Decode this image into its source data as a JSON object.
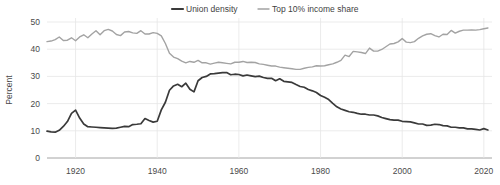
{
  "chart_data": {
    "type": "line",
    "title": "",
    "xlabel": "",
    "ylabel": "Percent",
    "xlim": [
      1913,
      2022
    ],
    "ylim": [
      0,
      50
    ],
    "grid": true,
    "legend_position": "top-center",
    "xticks": [
      1920,
      1940,
      1960,
      1980,
      2000,
      2020
    ],
    "yticks": [
      0,
      10,
      20,
      30,
      40,
      50
    ],
    "x": [
      1913,
      1914,
      1915,
      1916,
      1917,
      1918,
      1919,
      1920,
      1921,
      1922,
      1923,
      1924,
      1925,
      1926,
      1927,
      1928,
      1929,
      1930,
      1931,
      1932,
      1933,
      1934,
      1935,
      1936,
      1937,
      1938,
      1939,
      1940,
      1941,
      1942,
      1943,
      1944,
      1945,
      1946,
      1947,
      1948,
      1949,
      1950,
      1951,
      1952,
      1953,
      1954,
      1955,
      1956,
      1957,
      1958,
      1959,
      1960,
      1961,
      1962,
      1963,
      1964,
      1965,
      1966,
      1967,
      1968,
      1969,
      1970,
      1971,
      1972,
      1973,
      1974,
      1975,
      1976,
      1977,
      1978,
      1979,
      1980,
      1981,
      1982,
      1983,
      1984,
      1985,
      1986,
      1987,
      1988,
      1989,
      1990,
      1991,
      1992,
      1993,
      1994,
      1995,
      1996,
      1997,
      1998,
      1999,
      2000,
      2001,
      2002,
      2003,
      2004,
      2005,
      2006,
      2007,
      2008,
      2009,
      2010,
      2011,
      2012,
      2013,
      2014,
      2015,
      2016,
      2017,
      2018,
      2019,
      2020,
      2021
    ],
    "series": [
      {
        "name": "Union density",
        "color": "#3a3a3a",
        "width": 1.7,
        "values": [
          9.9,
          9.6,
          9.5,
          10.2,
          11.6,
          13.4,
          16.4,
          17.6,
          14.7,
          12.5,
          11.5,
          11.4,
          11.3,
          11.2,
          11.1,
          11.0,
          10.9,
          11.0,
          11.3,
          11.6,
          11.5,
          12.3,
          12.4,
          12.6,
          14.5,
          13.8,
          13.2,
          13.5,
          17.7,
          20.5,
          24.9,
          26.5,
          27.1,
          26.2,
          27.5,
          25.3,
          24.3,
          28.4,
          29.6,
          30.0,
          30.9,
          31.0,
          31.2,
          31.4,
          31.4,
          30.6,
          30.8,
          30.7,
          30.2,
          30.5,
          30.2,
          29.9,
          30.1,
          29.6,
          29.3,
          29.3,
          28.4,
          29.1,
          28.2,
          28.0,
          27.8,
          27.0,
          26.3,
          26.0,
          25.2,
          24.7,
          24.1,
          23.0,
          22.3,
          21.5,
          20.1,
          18.8,
          18.0,
          17.5,
          17.0,
          16.8,
          16.4,
          16.1,
          16.1,
          15.8,
          15.8,
          15.5,
          14.9,
          14.5,
          14.1,
          13.9,
          13.9,
          13.5,
          13.4,
          13.3,
          12.9,
          12.5,
          12.5,
          12.0,
          12.1,
          12.4,
          12.3,
          11.9,
          11.8,
          11.3,
          11.3,
          11.1,
          11.1,
          10.7,
          10.7,
          10.5,
          10.3,
          10.8,
          10.3
        ]
      },
      {
        "name": "Top 10% income share",
        "color": "#a3a3a3",
        "width": 1.4,
        "values": [
          42.8,
          43.0,
          43.5,
          44.5,
          43.2,
          43.3,
          44.2,
          43.1,
          44.5,
          45.3,
          44.2,
          45.6,
          46.8,
          45.3,
          46.8,
          47.3,
          46.7,
          45.4,
          45.0,
          46.3,
          46.5,
          46.0,
          45.8,
          46.8,
          45.6,
          45.6,
          46.1,
          45.8,
          44.9,
          42.1,
          38.5,
          37.1,
          36.5,
          35.6,
          35.0,
          35.5,
          35.2,
          35.9,
          35.0,
          35.0,
          34.5,
          34.9,
          35.2,
          35.0,
          34.8,
          34.6,
          35.2,
          35.2,
          35.5,
          35.1,
          35.2,
          35.1,
          34.6,
          34.4,
          34.1,
          33.8,
          33.8,
          33.4,
          33.2,
          33.0,
          32.8,
          32.6,
          32.6,
          33.0,
          33.3,
          33.5,
          33.9,
          33.8,
          33.9,
          34.3,
          34.6,
          35.2,
          35.9,
          37.8,
          37.3,
          39.2,
          39.0,
          38.8,
          38.4,
          40.4,
          39.3,
          39.3,
          39.9,
          40.9,
          41.9,
          42.1,
          42.7,
          43.9,
          42.6,
          42.4,
          42.8,
          44.0,
          44.9,
          45.5,
          45.7,
          45.0,
          44.5,
          45.5,
          45.4,
          46.9,
          45.9,
          46.6,
          47.0,
          47.0,
          47.1,
          47.0,
          47.2,
          47.5,
          47.8
        ]
      }
    ]
  },
  "legend": {
    "items": [
      {
        "label": "Union density",
        "color": "#3a3a3a"
      },
      {
        "label": "Top 10% income share",
        "color": "#a3a3a3"
      }
    ]
  },
  "axes": {
    "y_title": "Percent",
    "y_tick_labels": [
      "0",
      "10",
      "20",
      "30",
      "40",
      "50"
    ],
    "x_tick_labels": [
      "1920",
      "1940",
      "1960",
      "1980",
      "2000",
      "2020"
    ]
  }
}
